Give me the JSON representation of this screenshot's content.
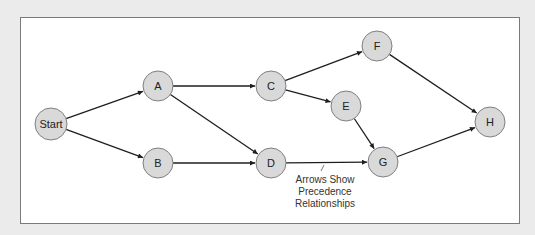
{
  "diagram": {
    "type": "precedence-network",
    "nodes": [
      {
        "id": "start",
        "label": "Start",
        "x": 51,
        "y": 124,
        "r": 16
      },
      {
        "id": "A",
        "label": "A",
        "x": 158,
        "y": 86,
        "r": 15
      },
      {
        "id": "B",
        "label": "B",
        "x": 158,
        "y": 163,
        "r": 15
      },
      {
        "id": "C",
        "label": "C",
        "x": 271,
        "y": 86,
        "r": 15
      },
      {
        "id": "D",
        "label": "D",
        "x": 271,
        "y": 163,
        "r": 15
      },
      {
        "id": "E",
        "label": "E",
        "x": 346,
        "y": 106,
        "r": 15
      },
      {
        "id": "F",
        "label": "F",
        "x": 377,
        "y": 46,
        "r": 15
      },
      {
        "id": "G",
        "label": "G",
        "x": 383,
        "y": 162,
        "r": 15
      },
      {
        "id": "H",
        "label": "H",
        "x": 490,
        "y": 122,
        "r": 15
      }
    ],
    "edges": [
      {
        "from": "start",
        "to": "A"
      },
      {
        "from": "start",
        "to": "B"
      },
      {
        "from": "A",
        "to": "C"
      },
      {
        "from": "A",
        "to": "D"
      },
      {
        "from": "B",
        "to": "D"
      },
      {
        "from": "C",
        "to": "F"
      },
      {
        "from": "C",
        "to": "E"
      },
      {
        "from": "D",
        "to": "G"
      },
      {
        "from": "E",
        "to": "G"
      },
      {
        "from": "F",
        "to": "H"
      },
      {
        "from": "G",
        "to": "H"
      }
    ],
    "annotation": {
      "lines": [
        "Arrows Show",
        "Precedence",
        "Relationships"
      ]
    },
    "colors": {
      "background": "#ebebeb",
      "panel": "#ffffff",
      "node_fill": "#d9d9d9",
      "node_stroke": "#7f7f7f",
      "edge": "#1e1e1e"
    }
  }
}
